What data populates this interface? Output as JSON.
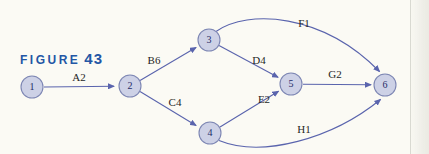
{
  "figure": {
    "label": "FIGURE",
    "number": "43"
  },
  "colors": {
    "paper": "#fbfaf4",
    "figure_label": "#2356a5",
    "node_fill": "#cdd1e6",
    "node_stroke": "#7d86b3",
    "edge_stroke": "#5a64ad",
    "edge_label_text": "#26261f",
    "node_number_text": "#1f2b66"
  },
  "graph": {
    "type": "directed-activity-network",
    "nodes": [
      {
        "id": "1"
      },
      {
        "id": "2"
      },
      {
        "id": "3"
      },
      {
        "id": "4"
      },
      {
        "id": "5"
      },
      {
        "id": "6"
      }
    ],
    "edges": [
      {
        "from": "1",
        "to": "2",
        "label": "A2",
        "curved": false
      },
      {
        "from": "2",
        "to": "3",
        "label": "B6",
        "curved": false
      },
      {
        "from": "2",
        "to": "4",
        "label": "C4",
        "curved": false
      },
      {
        "from": "3",
        "to": "5",
        "label": "D4",
        "curved": false
      },
      {
        "from": "3",
        "to": "6",
        "label": "F1",
        "curved": true
      },
      {
        "from": "4",
        "to": "5",
        "label": "E2",
        "curved": false
      },
      {
        "from": "4",
        "to": "6",
        "label": "H1",
        "curved": true
      },
      {
        "from": "5",
        "to": "6",
        "label": "G2",
        "curved": false
      }
    ]
  }
}
